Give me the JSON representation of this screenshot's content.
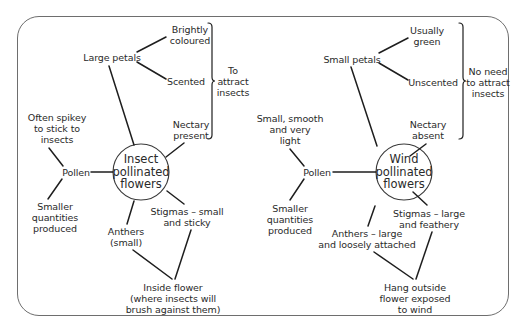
{
  "diagram": {
    "type": "comparison-spider-diagram",
    "colors": {
      "line": "#1e1e1e",
      "text": "#2a2a2a",
      "frame": "#6e6e6e",
      "background": "#ffffff"
    },
    "insect": {
      "hub": [
        "Insect",
        "pollinated",
        "flowers"
      ],
      "petals": "Large petals",
      "petal_feature_1": [
        "Brightly",
        "coloured"
      ],
      "petal_feature_2": "Scented",
      "nectary": [
        "Nectary",
        "present"
      ],
      "bracket_note": [
        "To",
        "attract",
        "insects"
      ],
      "pollen": "Pollen",
      "pollen_feature_1": [
        "Often spikey",
        "to stick to",
        "insects"
      ],
      "pollen_feature_2": [
        "Smaller",
        "quantities",
        "produced"
      ],
      "anthers": [
        "Anthers",
        "(small)"
      ],
      "stigmas": [
        "Stigmas – small",
        "and sticky"
      ],
      "position": [
        "Inside flower",
        "(where insects will",
        "brush against them)"
      ]
    },
    "wind": {
      "hub": [
        "Wind",
        "pollinated",
        "flowers"
      ],
      "petals": "Small petals",
      "petal_feature_1": [
        "Usually",
        "green"
      ],
      "petal_feature_2": "Unscented",
      "nectary": [
        "Nectary",
        "absent"
      ],
      "bracket_note": [
        "No need",
        "to attract",
        "insects"
      ],
      "pollen": "Pollen",
      "pollen_feature_1": [
        "Small, smooth",
        "and very",
        "light"
      ],
      "pollen_feature_2": [
        "Smaller",
        "quantities",
        "produced"
      ],
      "anthers": [
        "Anthers – large",
        "and loosely attached"
      ],
      "stigmas": [
        "Stigmas – large",
        "and feathery"
      ],
      "position": [
        "Hang outside",
        "flower exposed",
        "to wind"
      ]
    }
  }
}
